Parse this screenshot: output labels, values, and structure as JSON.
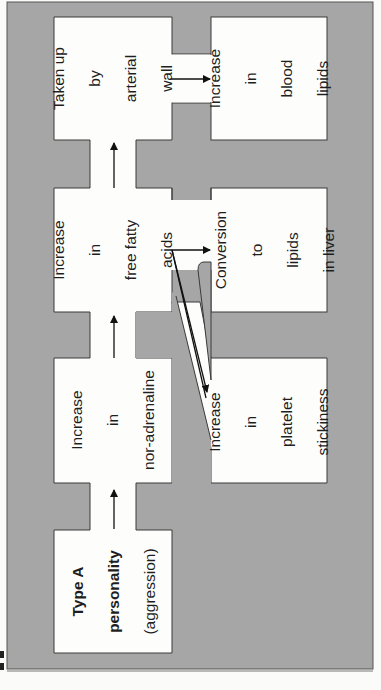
{
  "figure": {
    "orientation": "rotated 90° counter-clockwise",
    "colors": {
      "panel": "#a6a6a6",
      "box": "#fdfdfb",
      "outline": "#3a3a3a",
      "arrow": "#111111",
      "page": "#fbfbf9"
    },
    "boxes": {
      "type_a": {
        "bold_lines": [
          "Type A",
          "personality"
        ],
        "lines": [
          "(aggression)"
        ]
      },
      "noradrenaline": {
        "lines": [
          "Increase",
          "in",
          "nor-adrenaline"
        ]
      },
      "fatty_acids": {
        "lines": [
          "Increase",
          "in",
          "free fatty",
          "acids"
        ]
      },
      "arterial_wall": {
        "lines": [
          "Taken up",
          "by",
          "arterial",
          "wall"
        ]
      },
      "blood_lipids": {
        "lines": [
          "Increase",
          "in",
          "blood",
          "lipids"
        ]
      },
      "liver": {
        "lines": [
          "Conversion",
          "to",
          "lipids",
          "in liver"
        ]
      },
      "platelet": {
        "lines": [
          "Increase",
          "in",
          "platelet",
          "stickiness"
        ]
      }
    },
    "flow": [
      {
        "from": "Type A personality (aggression)",
        "to": "Increase in nor-adrenaline"
      },
      {
        "from": "Increase in nor-adrenaline",
        "to": "Increase in free fatty acids"
      },
      {
        "from": "Increase in free fatty acids",
        "to": "Taken up by arterial wall"
      },
      {
        "from": "Increase in free fatty acids",
        "to": "Conversion to lipids in liver"
      },
      {
        "from": "Increase in free fatty acids",
        "to": "Increase in platelet stickiness"
      },
      {
        "from": "Taken up by arterial wall",
        "to": "Increase in blood lipids"
      }
    ]
  }
}
